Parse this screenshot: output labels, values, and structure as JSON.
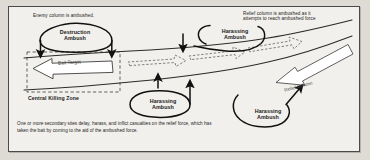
{
  "figure": {
    "border_color": "#4a4a4a",
    "background": "#f2f0ec"
  },
  "annotations": {
    "intro_note": "Enemy column is ambushed.",
    "relief_note": "Relief column is ambushed as it\nattempts to reach ambushed force",
    "caption": "One or more secondary sites delay, harass, and inflict casualties on the relief force, which has taken the bait by coming to the aid of the ambushed force."
  },
  "zones": {
    "killing_zone_label": "Central Killing Zone"
  },
  "ambushes": [
    {
      "id": "destruction",
      "label": "Destruction\nAmbush",
      "type": "destruction"
    },
    {
      "id": "harass-top",
      "label": "Harassing\nAmbush",
      "type": "harassing"
    },
    {
      "id": "harass-mid",
      "label": "Harassing\nAmbush",
      "type": "harassing"
    },
    {
      "id": "harass-right",
      "label": "Harassing\nAmbush",
      "type": "harassing"
    }
  ],
  "units": {
    "bait_target": "Bait Target",
    "relief_column": "Relief Column"
  },
  "colors": {
    "ink": "#1a1a1a",
    "road": "#2a2a2a",
    "dashed_unit": "#555555",
    "paper": "#f2f0ec",
    "page": "#dedad4"
  }
}
